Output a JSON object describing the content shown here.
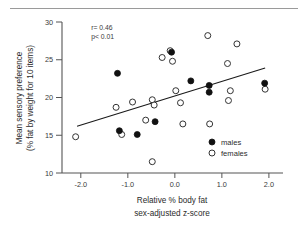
{
  "chart_data": {
    "type": "scatter",
    "title": "",
    "xlabel": "Relative % body fat",
    "xlabel_line2": "sex-adjusted  z-score",
    "ylabel": "Mean sensory preference",
    "ylabel_line2": "(% fat by weight for 10 items)",
    "xlim": [
      -2.4,
      2.3
    ],
    "ylim": [
      10,
      30
    ],
    "xticks": [
      -2.0,
      -1.0,
      0.0,
      1.0,
      2.0
    ],
    "xticklabels": [
      "-2.0",
      "-1.0",
      "0.0",
      "1.0",
      "2.0"
    ],
    "yticks": [
      10,
      15,
      20,
      25,
      30
    ],
    "yticklabels": [
      "10",
      "15",
      "20",
      "25",
      "30"
    ],
    "grid": false,
    "legend_position": "lower right",
    "annotations": [
      {
        "text": "r= 0.46",
        "x": -1.78,
        "y": 28.9
      },
      {
        "text": "p< 0.01",
        "x": -1.78,
        "y": 27.8
      }
    ],
    "fit_line": {
      "x": [
        -2.08,
        1.92
      ],
      "y": [
        16.2,
        23.9
      ]
    },
    "series": [
      {
        "name": "males",
        "marker": "filled-circle",
        "color": "#111111",
        "points": [
          {
            "x": -1.22,
            "y": 23.2
          },
          {
            "x": -1.18,
            "y": 15.6
          },
          {
            "x": -0.8,
            "y": 15.1
          },
          {
            "x": -0.42,
            "y": 16.8
          },
          {
            "x": -0.07,
            "y": 26.0
          },
          {
            "x": 0.34,
            "y": 22.2
          },
          {
            "x": 0.73,
            "y": 21.6
          },
          {
            "x": 0.73,
            "y": 20.7
          },
          {
            "x": 1.91,
            "y": 21.9
          }
        ]
      },
      {
        "name": "females",
        "marker": "open-circle",
        "color": "#333333",
        "points": [
          {
            "x": -2.11,
            "y": 14.8
          },
          {
            "x": -1.25,
            "y": 18.7
          },
          {
            "x": -1.13,
            "y": 15.1
          },
          {
            "x": -0.9,
            "y": 19.4
          },
          {
            "x": -0.62,
            "y": 17.0
          },
          {
            "x": -0.48,
            "y": 19.7
          },
          {
            "x": -0.48,
            "y": 11.5
          },
          {
            "x": -0.44,
            "y": 19.0
          },
          {
            "x": -0.27,
            "y": 25.3
          },
          {
            "x": -0.1,
            "y": 26.2
          },
          {
            "x": -0.05,
            "y": 24.8
          },
          {
            "x": 0.02,
            "y": 20.9
          },
          {
            "x": 0.12,
            "y": 19.3
          },
          {
            "x": 0.17,
            "y": 16.5
          },
          {
            "x": 0.7,
            "y": 28.2
          },
          {
            "x": 0.74,
            "y": 16.5
          },
          {
            "x": 1.12,
            "y": 24.5
          },
          {
            "x": 1.14,
            "y": 19.6
          },
          {
            "x": 1.18,
            "y": 20.9
          },
          {
            "x": 1.32,
            "y": 27.1
          },
          {
            "x": 1.92,
            "y": 21.1
          }
        ]
      }
    ],
    "legend": [
      {
        "label": "males",
        "marker": "filled-circle"
      },
      {
        "label": "females",
        "marker": "open-circle"
      }
    ]
  }
}
